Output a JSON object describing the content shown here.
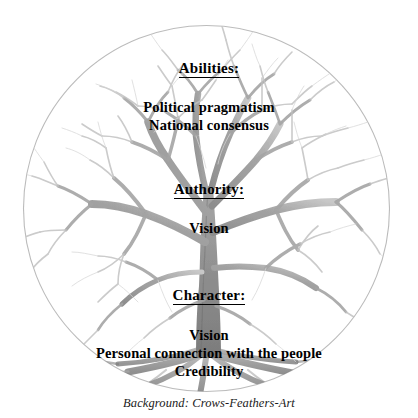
{
  "image": {
    "title": "Leadership tree diagram",
    "background_shape": "circle",
    "circle_stroke_color": "#b8b8b8",
    "tree_color": "#8d8d8d",
    "text_color": "#000000",
    "canvas": {
      "width": 418,
      "height": 418
    }
  },
  "sections": [
    {
      "key": "abilities",
      "heading": "Abilities:",
      "items": [
        "Political pragmatism",
        "National consensus"
      ]
    },
    {
      "key": "authority",
      "heading": "Authority:",
      "items": [
        "Vision"
      ]
    },
    {
      "key": "character",
      "heading": "Character:",
      "items": [
        "Vision",
        "Personal connection with the people",
        "Credibility"
      ]
    }
  ],
  "caption": "Background: Crows-Feathers-Art"
}
